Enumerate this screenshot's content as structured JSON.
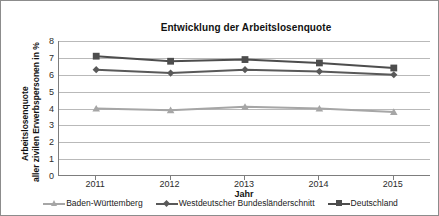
{
  "chart_data": {
    "type": "line",
    "title": "Entwicklung der Arbeitslosenquote",
    "xlabel": "Jahr",
    "ylabel": "Arbeitslosenquote aller zivilen Erwerbspersonen in %",
    "ylabel_lines": [
      "Arbeitslosenquote",
      "aller zivilen Erwerbspersonen in %"
    ],
    "categories": [
      "2011",
      "2012",
      "2013",
      "2014",
      "2015"
    ],
    "x": [
      2011,
      2012,
      2013,
      2014,
      2015
    ],
    "ylim": [
      0,
      8
    ],
    "yticks": [
      "8",
      "7",
      "6",
      "5",
      "4",
      "3",
      "2",
      "1",
      "0"
    ],
    "ytick_values": [
      8,
      7,
      6,
      5,
      4,
      3,
      2,
      1,
      0
    ],
    "grid": true,
    "legend_position": "bottom",
    "series": [
      {
        "name": "Baden-Württemberg",
        "values": [
          4.0,
          3.9,
          4.1,
          4.0,
          3.8
        ],
        "color": "#a6a6a6",
        "marker": "triangle"
      },
      {
        "name": "Westdeutscher Bundesländerschnitt",
        "values": [
          6.3,
          6.1,
          6.3,
          6.2,
          6.0
        ],
        "color": "#595959",
        "marker": "diamond"
      },
      {
        "name": "Deutschland",
        "values": [
          7.1,
          6.8,
          6.9,
          6.7,
          6.4
        ],
        "color": "#4d4d4d",
        "marker": "square"
      }
    ]
  },
  "colors": {
    "axis": "#7d7d7d",
    "grid": "#b9b9b9",
    "border": "#8c8c8c",
    "text": "#1a1a1a"
  }
}
